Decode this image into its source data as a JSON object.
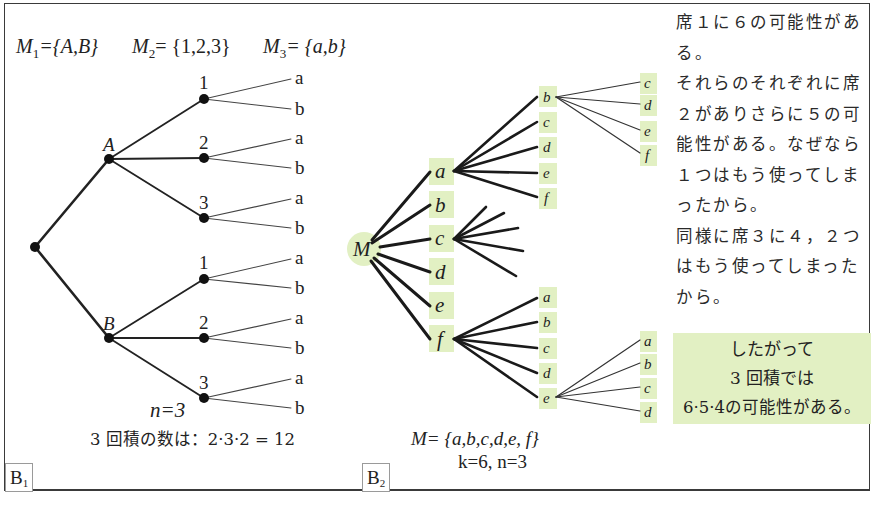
{
  "panel_b1": {
    "tag": "B",
    "tag_sub": "1",
    "sets": {
      "m1": {
        "name": "M",
        "sub": "1",
        "value": "={A,B}"
      },
      "m2": {
        "name": "M",
        "sub": "2",
        "value": "= {1,2,3}"
      },
      "m3": {
        "name": "M",
        "sub": "3",
        "value": "= {a,b}"
      }
    },
    "tree": {
      "level1": [
        "A",
        "B"
      ],
      "level2": [
        "1",
        "2",
        "3"
      ],
      "level3": [
        "a",
        "b"
      ]
    },
    "n_label": "n=3",
    "product_text": "3 回積の数は：2·3·2 = 12"
  },
  "panel_b2": {
    "tag": "B",
    "tag_sub": "2",
    "root": "M",
    "level1": [
      "a",
      "b",
      "c",
      "d",
      "e",
      "f"
    ],
    "branch_a_children": [
      "b",
      "c",
      "d",
      "e",
      "f"
    ],
    "branch_ab_children": [
      "c",
      "d",
      "e",
      "f"
    ],
    "branch_f_children": [
      "a",
      "b",
      "c",
      "d",
      "e"
    ],
    "branch_fe_children": [
      "a",
      "b",
      "c",
      "d"
    ],
    "set_label": "M= {a,b,c,d,e, f}",
    "params_label": "k=6,  n=3",
    "highlight_color": "#e2f0c3"
  },
  "explanation": {
    "lines": [
      "席１に６の可能性があ",
      "る。",
      "それらのそれぞれに席",
      "２がありさらに５の可",
      "能性がある。なぜなら",
      "１つはもう使ってしま",
      "ったから。",
      "同様に席３に４，２つ",
      "はもう使ってしまった",
      "から。"
    ],
    "conclusion": {
      "line1": "したがって",
      "line2": "3 回積では",
      "line3": "6·5·4の可能性がある。"
    }
  }
}
